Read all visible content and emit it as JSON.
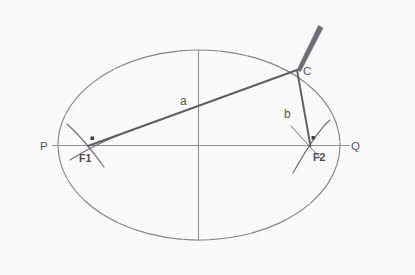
{
  "figure": {
    "type": "geometric-diagram",
    "background_color": "#fbfbfb",
    "stroke_color_primary": "#555555",
    "stroke_color_axis": "#8f8f96",
    "stroke_color_ellipse": "#7a7a80",
    "width": 415,
    "height": 275
  },
  "labels": {
    "p": "P",
    "q": "Q",
    "c": "C",
    "f1": "F1",
    "f2": "F2",
    "a": "a",
    "b": "b"
  },
  "geometry": {
    "ellipse": {
      "center_x": 199,
      "center_y": 145,
      "semi_major_x": 141,
      "semi_minor_y": 95
    },
    "major_axis": {
      "x1": 52,
      "y1": 145,
      "x2": 348,
      "y2": 145
    },
    "minor_axis": {
      "x1": 198,
      "y1": 50,
      "x2": 198,
      "y2": 241
    },
    "focus_1": {
      "x": 88,
      "y": 146
    },
    "focus_2": {
      "x": 310,
      "y": 146
    },
    "point_c": {
      "x": 297,
      "y": 70
    },
    "segment_a": {
      "x1": 88,
      "y1": 146,
      "x2": 297,
      "y2": 70
    },
    "segment_b": {
      "x1": 297,
      "y1": 70,
      "x2": 310,
      "y2": 146
    },
    "pencil": {
      "x1": 297,
      "y1": 70,
      "x2": 322,
      "y2": 26
    }
  },
  "label_positions": {
    "p": {
      "x": 40,
      "y": 149
    },
    "q": {
      "x": 352,
      "y": 149
    },
    "c": {
      "x": 303,
      "y": 74
    },
    "f1": {
      "x": 80,
      "y": 161
    },
    "f2": {
      "x": 314,
      "y": 160
    },
    "a": {
      "x": 182,
      "y": 104
    },
    "b": {
      "x": 285,
      "y": 117
    }
  }
}
